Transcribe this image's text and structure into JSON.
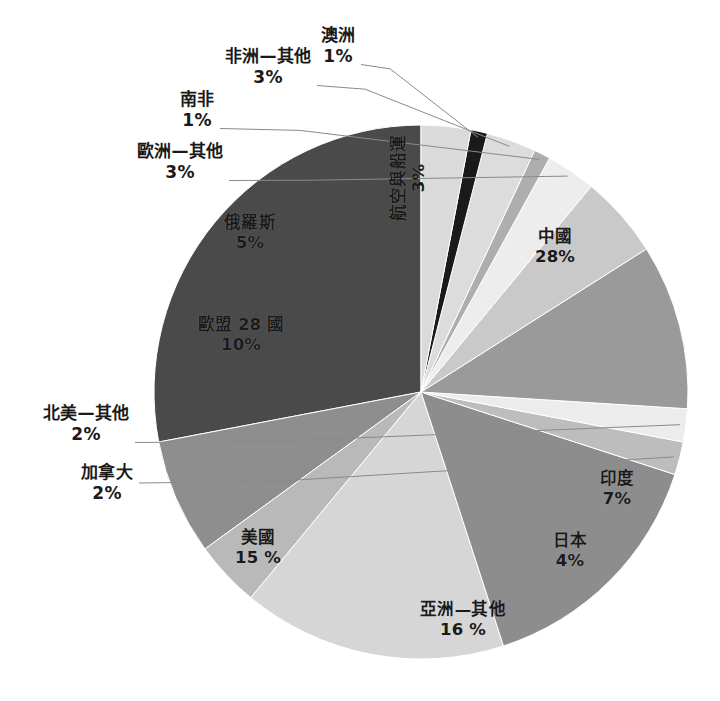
{
  "chart_data": {
    "type": "pie",
    "title": "",
    "subtitle": "",
    "xlabel": "",
    "ylabel": "",
    "legend_position": "none",
    "grid": false,
    "units": "percent",
    "start_angle_deg": 0,
    "direction": "counterclockwise",
    "categories": [
      "中國",
      "印度",
      "日本",
      "亞洲—其他",
      "美國",
      "加拿大",
      "北美—其他",
      "歐盟 28 國",
      "俄羅斯",
      "歐洲—其他",
      "南非",
      "非洲—其他",
      "澳洲",
      "航空與船運"
    ],
    "values": [
      28,
      7,
      4,
      16,
      15,
      2,
      2,
      10,
      5,
      3,
      1,
      3,
      1,
      3
    ],
    "value_labels": [
      "28%",
      "7%",
      "4%",
      "16 %",
      "15 %",
      "2%",
      "2%",
      "10%",
      "5%",
      "3%",
      "1%",
      "3%",
      "1%",
      "3%"
    ],
    "colors": [
      "#4a4a4a",
      "#8e8e8e",
      "#b9b9b9",
      "#d6d6d6",
      "#8d8d8d",
      "#bdbdbd",
      "#ececec",
      "#9a9a9a",
      "#c9c9c9",
      "#ededed",
      "#aeaeae",
      "#dcdcdc",
      "#1a1a1a",
      "#dadada"
    ]
  },
  "slices": [
    {
      "name": "中國",
      "pct": "28%",
      "label_placement": "inside",
      "label_x": 555,
      "label_y": 247,
      "rotated": false
    },
    {
      "name": "印度",
      "pct": "7%",
      "label_placement": "inside",
      "label_x": 617,
      "label_y": 489,
      "rotated": false
    },
    {
      "name": "日本",
      "pct": "4%",
      "label_placement": "inside",
      "label_x": 570,
      "label_y": 551,
      "rotated": false
    },
    {
      "name": "亞洲—其他",
      "pct": "16 %",
      "label_placement": "inside",
      "label_x": 463,
      "label_y": 620,
      "rotated": false
    },
    {
      "name": "美國",
      "pct": "15 %",
      "label_placement": "inside",
      "label_x": 258,
      "label_y": 548,
      "rotated": false
    },
    {
      "name": "加拿大",
      "pct": "2%",
      "label_placement": "outside",
      "label_x": 107,
      "label_y": 483,
      "rotated": false
    },
    {
      "name": "北美—其他",
      "pct": "2%",
      "label_placement": "outside",
      "label_x": 86,
      "label_y": 424,
      "rotated": false
    },
    {
      "name": "歐盟 28 國",
      "pct": "10%",
      "label_placement": "inside",
      "label_x": 241,
      "label_y": 335,
      "rotated": false
    },
    {
      "name": "俄羅斯",
      "pct": "5%",
      "label_placement": "inside",
      "label_x": 250,
      "label_y": 233,
      "rotated": false
    },
    {
      "name": "歐洲—其他",
      "pct": "3%",
      "label_placement": "outside",
      "label_x": 180,
      "label_y": 162,
      "rotated": false
    },
    {
      "name": "南非",
      "pct": "1%",
      "label_placement": "outside",
      "label_x": 197,
      "label_y": 110,
      "rotated": false
    },
    {
      "name": "非洲—其他",
      "pct": "3%",
      "label_placement": "outside",
      "label_x": 268,
      "label_y": 67,
      "rotated": false
    },
    {
      "name": "澳洲",
      "pct": "1%",
      "label_placement": "outside",
      "label_x": 338,
      "label_y": 46,
      "rotated": false
    },
    {
      "name": "航空與船運",
      "pct": "3%",
      "label_placement": "inside",
      "label_x": 409,
      "label_y": 178,
      "rotated": true
    }
  ]
}
